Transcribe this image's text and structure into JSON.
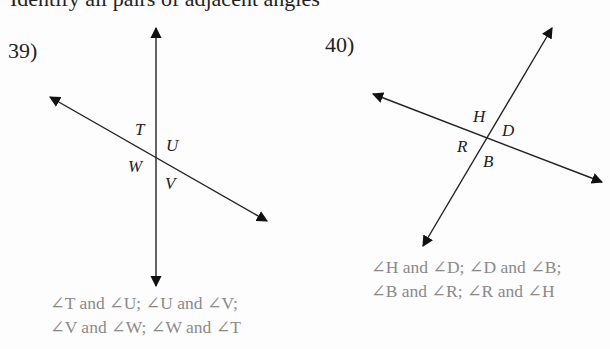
{
  "header": {
    "clipped_text": "Identify all pairs of adjacent angles"
  },
  "problems": [
    {
      "number": "39)",
      "labels": {
        "T": "T",
        "U": "U",
        "W": "W",
        "V": "V"
      },
      "answer_lines": [
        "∠T and ∠U; ∠U and ∠V;",
        "∠V and ∠W; ∠W and ∠T"
      ]
    },
    {
      "number": "40)",
      "labels": {
        "H": "H",
        "D": "D",
        "R": "R",
        "B": "B"
      },
      "answer_lines": [
        "∠H and ∠D; ∠D and ∠B;",
        "∠B and ∠R; ∠R and ∠H"
      ]
    }
  ],
  "colors": {
    "lines": "#222222",
    "answer_text": "#8a8a8a"
  }
}
